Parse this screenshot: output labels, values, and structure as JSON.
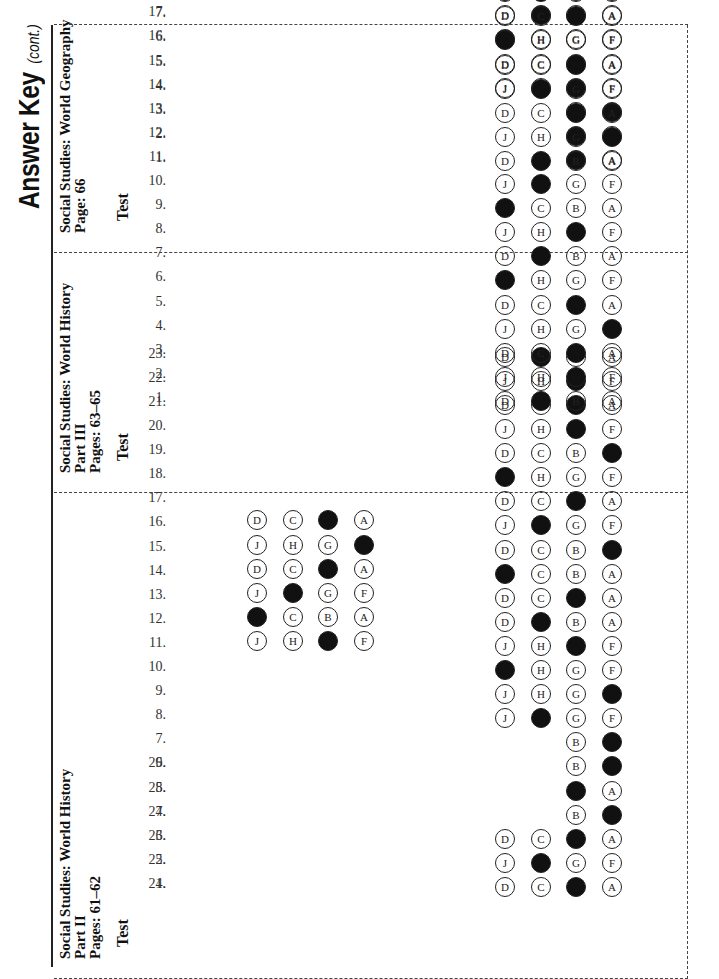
{
  "header": {
    "title": "Answer Key",
    "subtitle": "(cont.)"
  },
  "sections": [
    {
      "id": "part2",
      "heading": [
        "Social Studies: World History",
        "Part II",
        "Pages: 61–62"
      ],
      "test_label": "Test",
      "questions": [
        {
          "n": "1.",
          "choices": [
            "A",
            "B",
            "C",
            "D"
          ],
          "answer": "B"
        },
        {
          "n": "2.",
          "choices": [
            "F",
            "G",
            "H",
            "J"
          ],
          "answer": "H"
        },
        {
          "n": "3.",
          "choices": [
            "A",
            "B",
            "C",
            "D"
          ],
          "answer": "B"
        },
        {
          "n": "4.",
          "choices": [
            "A",
            "B"
          ],
          "answer": "A"
        },
        {
          "n": "5.",
          "choices": [
            "A",
            "B"
          ],
          "answer": "B"
        },
        {
          "n": "6.",
          "choices": [
            "A",
            "B"
          ],
          "answer": "A"
        },
        {
          "n": "7.",
          "choices": [
            "A",
            "B"
          ],
          "answer": "A"
        },
        {
          "n": "8.",
          "choices": [
            "F",
            "G",
            "H",
            "J"
          ],
          "answer": "H"
        },
        {
          "n": "9.",
          "choices": [
            "A",
            "G",
            "H",
            "J"
          ],
          "answer": "A"
        },
        {
          "n": "10.",
          "choices": [
            "F",
            "G",
            "H",
            "J"
          ],
          "answer": "J"
        },
        {
          "n": "11.",
          "choices": [
            "F",
            "G",
            "H",
            "J"
          ],
          "answer": "G"
        },
        {
          "n": "12.",
          "choices": [
            "A",
            "B",
            "C",
            "D"
          ],
          "answer": "C"
        },
        {
          "n": "13.",
          "choices": [
            "A",
            "B",
            "C",
            "D"
          ],
          "answer": "B"
        },
        {
          "n": "14.",
          "choices": [
            "A",
            "B",
            "C",
            "D"
          ],
          "answer": "D"
        },
        {
          "n": "15.",
          "choices": [
            "A",
            "B",
            "C",
            "D"
          ],
          "answer": "A"
        },
        {
          "n": "16.",
          "choices": [
            "F",
            "G",
            "H",
            "J"
          ],
          "answer": "H"
        },
        {
          "n": "17.",
          "choices": [
            "A",
            "B",
            "C",
            "D"
          ],
          "answer": "B"
        },
        {
          "n": "18.",
          "choices": [
            "F",
            "G",
            "H",
            "J"
          ],
          "answer": "J"
        },
        {
          "n": "19.",
          "choices": [
            "A",
            "B",
            "C",
            "D"
          ],
          "answer": "A"
        },
        {
          "n": "20.",
          "choices": [
            "F",
            "G",
            "H",
            "J"
          ],
          "answer": "G"
        },
        {
          "n": "21.",
          "choices": [
            "A",
            "B",
            "C",
            "D"
          ],
          "answer": "B"
        },
        {
          "n": "22.",
          "choices": [
            "F",
            "G",
            "H",
            "J"
          ],
          "answer": "G"
        },
        {
          "n": "23.",
          "choices": [
            "A",
            "B",
            "C",
            "D"
          ],
          "answer": "C"
        }
      ],
      "questions_col2": [
        {
          "n": "24.",
          "choices": [
            "F",
            "G",
            "H",
            "J"
          ],
          "answer": "G"
        },
        {
          "n": "25.",
          "choices": [
            "A",
            "B",
            "C",
            "D"
          ],
          "answer": "D"
        },
        {
          "n": "26.",
          "choices": [
            "F",
            "G",
            "H",
            "J"
          ],
          "answer": "H"
        },
        {
          "n": "27.",
          "choices": [
            "A",
            "B",
            "C",
            "D"
          ],
          "answer": "B"
        },
        {
          "n": "28.",
          "choices": [
            "F",
            "G",
            "H",
            "J"
          ],
          "answer": "F"
        },
        {
          "n": "29.",
          "choices": [
            "A",
            "B",
            "C",
            "D"
          ],
          "answer": "B"
        }
      ]
    },
    {
      "id": "part3",
      "heading": [
        "Social Studies: World History",
        "Part III",
        "Pages: 63–65"
      ],
      "test_label": "Test",
      "questions": [
        {
          "n": "1.",
          "choices": [
            "A",
            "B",
            "C",
            "D"
          ],
          "answer": "C"
        },
        {
          "n": "2.",
          "choices": [
            "F",
            "G",
            "H",
            "J"
          ],
          "answer": "G"
        },
        {
          "n": "3.",
          "choices": [
            "A",
            "B",
            "C",
            "D"
          ],
          "answer": "B"
        },
        {
          "n": "4.",
          "choices": [
            "F",
            "G",
            "H",
            "J"
          ],
          "answer": "F"
        },
        {
          "n": "5.",
          "choices": [
            "A",
            "B",
            "C",
            "D"
          ],
          "answer": "B"
        },
        {
          "n": "6.",
          "choices": [
            "F",
            "G",
            "H",
            "J"
          ],
          "answer": "J"
        },
        {
          "n": "7.",
          "choices": [
            "A",
            "B",
            "C",
            "D"
          ],
          "answer": "C"
        },
        {
          "n": "8.",
          "choices": [
            "F",
            "G",
            "H",
            "J"
          ],
          "answer": "G"
        },
        {
          "n": "9.",
          "choices": [
            "A",
            "B",
            "C",
            "D"
          ],
          "answer": "D"
        },
        {
          "n": "10.",
          "choices": [
            "F",
            "G",
            "H",
            "J"
          ],
          "answer": "H"
        },
        {
          "n": "11.",
          "choices": [
            "A",
            "B"
          ],
          "answer": "B"
        },
        {
          "n": "12.",
          "choices": [
            "A",
            "B"
          ],
          "answer": "B"
        },
        {
          "n": "13.",
          "choices": [
            "A",
            "B"
          ],
          "answer": "A"
        },
        {
          "n": "14.",
          "choices": [
            "F",
            "G",
            "H",
            "J"
          ],
          "answer": "G"
        },
        {
          "n": "15.",
          "choices": [
            "A",
            "B",
            "C",
            "D"
          ],
          "answer": "B"
        },
        {
          "n": "16.",
          "choices": [
            "F",
            "G",
            "H",
            "J"
          ],
          "answer": "J"
        },
        {
          "n": "17.",
          "choices": [
            "A",
            "B",
            "C",
            "D"
          ],
          "answer": "C"
        },
        {
          "n": "18.",
          "choices": [
            "F",
            "G",
            "H",
            "J"
          ],
          "answer": "J"
        }
      ]
    },
    {
      "id": "geography",
      "heading": [
        "Social Studies: World Geography",
        "Page: 66"
      ],
      "test_label": "Test",
      "questions": [
        {
          "n": "1.",
          "choices": [
            "A",
            "B",
            "C",
            "D"
          ],
          "answer": "C"
        },
        {
          "n": "2.",
          "choices": [
            "F",
            "G",
            "H",
            "J"
          ],
          "answer": "F"
        },
        {
          "n": "3.",
          "choices": [
            "A",
            "B",
            "C",
            "D"
          ],
          "answer": "B"
        },
        {
          "n": "4.",
          "choices": [
            "F",
            "G",
            "H",
            "J"
          ],
          "answer": "H"
        },
        {
          "n": "5.",
          "choices": [
            "A",
            "B",
            "C",
            "D"
          ],
          "answer": "B"
        },
        {
          "n": "6.",
          "choices": [
            "F",
            "G",
            "H",
            "J"
          ],
          "answer": "J"
        },
        {
          "n": "7.",
          "choices": [
            "A",
            "B",
            "C",
            "D"
          ],
          "answer": "B"
        },
        {
          "n": "8.",
          "choices": [
            "F",
            "G",
            "H",
            "J"
          ],
          "answer": "H"
        },
        {
          "n": "9.",
          "choices": [
            "A",
            "B",
            "C",
            "D"
          ],
          "answer": "C"
        },
        {
          "n": "10.",
          "choices": [
            "F",
            "G",
            "H",
            "J"
          ],
          "answer": "G"
        },
        {
          "n": "11.",
          "choices": [
            "A",
            "B",
            "C",
            "D"
          ],
          "answer": "A"
        },
        {
          "n": "12.",
          "choices": [
            "F",
            "G",
            "H",
            "J"
          ],
          "answer": "G"
        }
      ]
    }
  ]
}
